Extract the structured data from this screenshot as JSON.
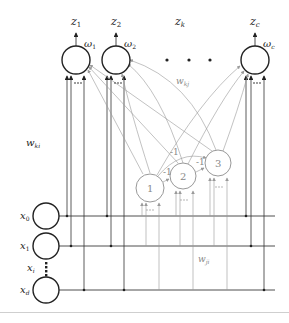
{
  "diagram": {
    "type": "neural-network",
    "outputs": [
      {
        "id": "omega1",
        "unit_label": "ω1",
        "unit_base": "ω",
        "unit_sub": "1",
        "out_label_base": "z",
        "out_label_sub": "1"
      },
      {
        "id": "omega2",
        "unit_label": "ω2",
        "unit_base": "ω",
        "unit_sub": "2",
        "out_label_base": "z",
        "out_label_sub": "2"
      },
      {
        "id": "omegac",
        "unit_label": "ωc",
        "unit_base": "ω",
        "unit_sub": "c",
        "out_label_base": "z",
        "out_label_sub": "c"
      }
    ],
    "middle_output_label": {
      "base": "z",
      "sub": "k"
    },
    "ellipsis": "• • •",
    "hidden": [
      {
        "id": "h1",
        "label": "1"
      },
      {
        "id": "h2",
        "label": "2"
      },
      {
        "id": "h3",
        "label": "3"
      }
    ],
    "inhibitory_weights": [
      "-1",
      "-1",
      "-1"
    ],
    "inputs": [
      {
        "id": "x0",
        "base": "x",
        "sub": "0"
      },
      {
        "id": "x1",
        "base": "x",
        "sub": "1"
      },
      {
        "id": "xi",
        "base": "x",
        "sub": "i"
      },
      {
        "id": "xd",
        "base": "x",
        "sub": "d"
      }
    ],
    "weight_labels": {
      "wki": {
        "base": "w",
        "sub": "ki"
      },
      "wkj": {
        "base": "w",
        "sub": "kj"
      },
      "wji": {
        "base": "w",
        "sub": "ji"
      }
    },
    "colors": {
      "primary_stroke": "#222222",
      "secondary_stroke": "#999999",
      "background": "#ffffff"
    }
  }
}
